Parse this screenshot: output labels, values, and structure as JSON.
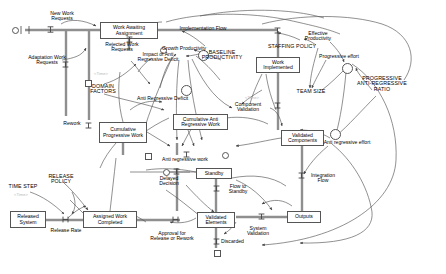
{
  "diagram": {
    "type": "stock-and-flow",
    "colors": {
      "stroke": "#555555",
      "flow_pipe": "#8a8a8a",
      "text": "#000000",
      "ghost_text": "#b9b9b9",
      "background": "#ffffff"
    },
    "stocks": [
      {
        "id": "work-awaiting-assignment",
        "label": "Work Awaiting\nAssignment",
        "x": 100,
        "y": 22,
        "w": 58,
        "h": 17
      },
      {
        "id": "cumulative-progressive-work",
        "label": "Cumulative\nProgressive\nWork",
        "x": 99,
        "y": 122,
        "w": 48,
        "h": 21
      },
      {
        "id": "cumulative-anti-regressive-work",
        "label": "Cumulative Anti\nRegressive Work",
        "x": 173,
        "y": 114,
        "w": 55,
        "h": 16
      },
      {
        "id": "work-implemented",
        "label": "Work\nImplemented",
        "x": 256,
        "y": 57,
        "w": 44,
        "h": 16
      },
      {
        "id": "validated-components",
        "label": "Validated\nComponents",
        "x": 281,
        "y": 130,
        "w": 43,
        "h": 16
      },
      {
        "id": "standby",
        "label": "Standby",
        "x": 196,
        "y": 168,
        "w": 36,
        "h": 11
      },
      {
        "id": "validated-elements",
        "label": "Validated\nElements",
        "x": 197,
        "y": 212,
        "w": 38,
        "h": 16
      },
      {
        "id": "outputs",
        "label": "Outputs",
        "x": 287,
        "y": 211,
        "w": 34,
        "h": 12
      },
      {
        "id": "assigned-work-completed",
        "label": "Assigned Work\nCompleted",
        "x": 83,
        "y": 211,
        "w": 54,
        "h": 17
      },
      {
        "id": "released-system",
        "label": "Released\nSystem",
        "x": 10,
        "y": 211,
        "w": 36,
        "h": 17
      }
    ],
    "flow_labels": [
      {
        "id": "new-work-requests",
        "label": "New Work\nRequests",
        "x": 39,
        "y": 11
      },
      {
        "id": "adaptation-work-requests",
        "label": "Adaptation Work\nRequests",
        "x": 27,
        "y": 55
      },
      {
        "id": "rejected-work-requests",
        "label": "Rejected Work\nRequests",
        "x": 99,
        "y": 42
      },
      {
        "id": "implementation-flow",
        "label": "Implementation Flow",
        "x": 196,
        "y": 27
      },
      {
        "id": "component-validation",
        "label": "Component\nValidation",
        "x": 239,
        "y": 103
      },
      {
        "id": "integration-flow",
        "label": "Integration\nFlow",
        "x": 315,
        "y": 175
      },
      {
        "id": "system-validation",
        "label": "System\nValidation",
        "x": 244,
        "y": 212
      },
      {
        "id": "flow-to-standby",
        "label": "Flow to\nStandby",
        "x": 226,
        "y": 186
      },
      {
        "id": "discarded",
        "label": "Discarded",
        "x": 222,
        "y": 240
      },
      {
        "id": "approval-for-release-or-rework",
        "label": "Approval for\nRelease or Rework",
        "x": 146,
        "y": 228
      },
      {
        "id": "release-rate",
        "label": "Release Rate",
        "x": 41,
        "y": 228
      },
      {
        "id": "rework",
        "label": "Rework",
        "x": 66,
        "y": 124
      },
      {
        "id": "delayed-decision",
        "label": "Delayed\nDecision",
        "x": 162,
        "y": 178
      },
      {
        "id": "anti-regressive-work",
        "label": "Anti regressive work",
        "x": 183,
        "y": 150
      },
      {
        "id": "growth-productivity",
        "label": "Growth Productivity",
        "x": 171,
        "y": 48
      },
      {
        "id": "anti-regressive-deficit",
        "label": "Anti Regressive Deficit",
        "x": 146,
        "y": 93
      },
      {
        "id": "impact-of-anti-regressive-deficit",
        "label": "Impact of Anti\nRegressive Deficit",
        "x": 134,
        "y": 54
      },
      {
        "id": "effective-productivity",
        "label": "Effective\nProductivity",
        "x": 318,
        "y": 33
      },
      {
        "id": "progressive-effort",
        "label": "Progressive effort",
        "x": 337,
        "y": 56
      },
      {
        "id": "anti-regressive-effort",
        "label": "Anti regressive effort",
        "x": 314,
        "y": 141
      }
    ],
    "constants": [
      {
        "id": "domain-factors",
        "label": "DOMAIN\nFACTORS",
        "x": 99,
        "y": 86
      },
      {
        "id": "baseline-productivity",
        "label": "BASELINE\nPRODUCTIVITY",
        "x": 222,
        "y": 52
      },
      {
        "id": "staffing-policy",
        "label": "STAFFING POLICY",
        "x": 291,
        "y": 46
      },
      {
        "id": "team-size",
        "label": "TEAM SIZE",
        "x": 311,
        "y": 91
      },
      {
        "id": "progressive-anti-regressive-ratio",
        "label": "PROGRESSIVE\nANTI-REGRESSIVE\nRATIO",
        "x": 381,
        "y": 82
      },
      {
        "id": "release-policy",
        "label": "RELEASE\nPOLICY",
        "x": 58,
        "y": 177
      },
      {
        "id": "time-step",
        "label": "TIME STEP",
        "x": 18,
        "y": 186
      }
    ],
    "ghosts": [
      {
        "id": "time-ghost-1",
        "label": "<Time>",
        "x": 94,
        "y": 73
      },
      {
        "id": "time-ghost-2",
        "label": "<Time>",
        "x": 245,
        "y": 97
      },
      {
        "id": "time-ghost-3",
        "label": "<Time>",
        "x": 14,
        "y": 194
      }
    ]
  }
}
